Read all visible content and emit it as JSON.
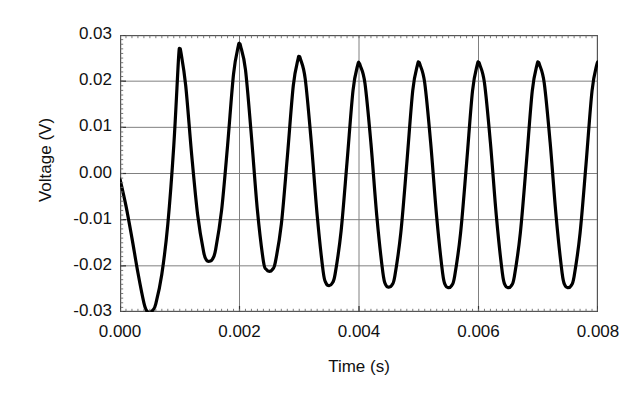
{
  "chart_data": {
    "type": "line",
    "title": "",
    "xlabel": "Time (s)",
    "ylabel": "Voltage (V)",
    "xlim": [
      0.0,
      0.008
    ],
    "ylim": [
      -0.03,
      0.03
    ],
    "xticklabels": [
      "0.000",
      "0.002",
      "0.004",
      "0.006",
      "0.008"
    ],
    "xtickvalues": [
      0.0,
      0.002,
      0.004,
      0.006,
      0.008
    ],
    "yticklabels": [
      "0.03",
      "0.02",
      "0.01",
      "0.00",
      "-0.01",
      "-0.02",
      "-0.03"
    ],
    "ytickvalues": [
      0.03,
      0.02,
      0.01,
      0.0,
      -0.01,
      -0.02,
      -0.03
    ],
    "grid": "horizontal-and-vertical",
    "grid_color": "#808080",
    "frame_color": "#555555",
    "line_color": "#000000",
    "line_width": 3.2,
    "background": "#ffffff",
    "legend": null,
    "series": [
      {
        "name": "Voltage",
        "x": [
          0.0,
          0.0001,
          0.0002,
          0.0003,
          0.0004,
          0.00045,
          0.0005,
          0.00055,
          0.0006,
          0.0007,
          0.0008,
          0.0009,
          0.00098,
          0.001,
          0.00102,
          0.0011,
          0.0012,
          0.0013,
          0.0014,
          0.00145,
          0.0015,
          0.00155,
          0.0016,
          0.0017,
          0.0018,
          0.0019,
          0.00198,
          0.002,
          0.00202,
          0.0021,
          0.0022,
          0.0023,
          0.0024,
          0.00245,
          0.0025,
          0.00255,
          0.0026,
          0.0027,
          0.0028,
          0.0029,
          0.00298,
          0.003,
          0.00302,
          0.0031,
          0.0032,
          0.0033,
          0.0034,
          0.00345,
          0.0035,
          0.00355,
          0.0036,
          0.0037,
          0.0038,
          0.0039,
          0.00398,
          0.004,
          0.00402,
          0.0041,
          0.0042,
          0.0043,
          0.0044,
          0.00445,
          0.0045,
          0.00455,
          0.0046,
          0.0047,
          0.0048,
          0.0049,
          0.00498,
          0.005,
          0.00502,
          0.0051,
          0.0052,
          0.0053,
          0.0054,
          0.00545,
          0.0055,
          0.00555,
          0.0056,
          0.0057,
          0.0058,
          0.0059,
          0.00598,
          0.006,
          0.00602,
          0.0061,
          0.0062,
          0.0063,
          0.0064,
          0.00645,
          0.0065,
          0.00655,
          0.0066,
          0.0067,
          0.0068,
          0.0069,
          0.00698,
          0.007,
          0.00702,
          0.0071,
          0.0072,
          0.0073,
          0.0074,
          0.00745,
          0.0075,
          0.00755,
          0.0076,
          0.0077,
          0.0078,
          0.0079,
          0.00798,
          0.008
        ],
        "y": [
          -0.0012,
          -0.007,
          -0.014,
          -0.0215,
          -0.028,
          -0.0298,
          -0.03,
          -0.0296,
          -0.0282,
          -0.0218,
          -0.011,
          0.006,
          0.025,
          0.0268,
          0.0262,
          0.019,
          0.004,
          -0.009,
          -0.017,
          -0.0188,
          -0.019,
          -0.0185,
          -0.0165,
          -0.008,
          0.006,
          0.0215,
          0.0276,
          0.028,
          0.0275,
          0.0225,
          0.008,
          -0.008,
          -0.019,
          -0.0208,
          -0.0212,
          -0.0208,
          -0.0192,
          -0.011,
          0.0035,
          0.019,
          0.0248,
          0.0252,
          0.0248,
          0.0205,
          0.007,
          -0.009,
          -0.0212,
          -0.0238,
          -0.0243,
          -0.0238,
          -0.0218,
          -0.0125,
          0.0025,
          0.018,
          0.0236,
          0.0238,
          0.0234,
          0.0195,
          0.0065,
          -0.0095,
          -0.0215,
          -0.0242,
          -0.0246,
          -0.0242,
          -0.0222,
          -0.0128,
          0.0022,
          0.018,
          0.0236,
          0.024,
          0.0236,
          0.0196,
          0.0066,
          -0.0094,
          -0.0216,
          -0.0243,
          -0.0247,
          -0.0243,
          -0.0223,
          -0.0129,
          0.0021,
          0.0179,
          0.0236,
          0.024,
          0.0236,
          0.0196,
          0.0066,
          -0.0094,
          -0.0216,
          -0.0243,
          -0.0247,
          -0.0243,
          -0.0223,
          -0.0129,
          0.0021,
          0.0179,
          0.0236,
          0.024,
          0.0236,
          0.0196,
          0.0066,
          -0.0094,
          -0.0216,
          -0.0243,
          -0.0247,
          -0.0243,
          -0.0223,
          -0.0129,
          0.0021,
          0.0179,
          0.0236,
          0.024
        ]
      }
    ]
  },
  "axis": {
    "ylabel_text": "Voltage (V)",
    "xlabel_text": "Time (s)"
  }
}
